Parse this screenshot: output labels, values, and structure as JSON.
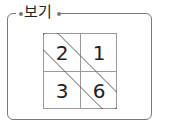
{
  "box": {
    "title": "보기",
    "border_color": "#7a7a7a"
  },
  "grid": {
    "cells": [
      {
        "row": 0,
        "col": 0,
        "value": "2"
      },
      {
        "row": 0,
        "col": 1,
        "value": "1"
      },
      {
        "row": 1,
        "col": 0,
        "value": "3"
      },
      {
        "row": 1,
        "col": 1,
        "value": "6"
      }
    ],
    "highlight": "diagonal loop enclosing 2 and 6"
  }
}
